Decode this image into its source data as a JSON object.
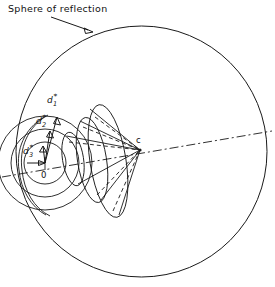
{
  "figure": {
    "kind": "crystallography-ewald-sphere-diagram",
    "annotation": {
      "text": "Sphere of reflection",
      "leader": "arrow-pointing-down-right"
    },
    "points": [
      {
        "id": "origin",
        "label": "0"
      },
      {
        "id": "center",
        "label": "c"
      }
    ],
    "vectors": [
      {
        "id": "d1",
        "base": "d",
        "sub": "1",
        "sup": "*"
      },
      {
        "id": "d2",
        "base": "d",
        "sub": "2",
        "sup": "*"
      },
      {
        "id": "d3",
        "base": "d",
        "sub": "3",
        "sup": "*"
      }
    ],
    "elements": {
      "sphere_label": "sphere-of-reflection-circle",
      "axis_label": "rotation-axis-dash-dot-line",
      "cone1_label": "laue-cone-1",
      "cone2_label": "laue-cone-2",
      "cone3_label": "laue-cone-3"
    },
    "colors": {
      "ink": "#1a1a1a",
      "background": "#ffffff"
    }
  }
}
